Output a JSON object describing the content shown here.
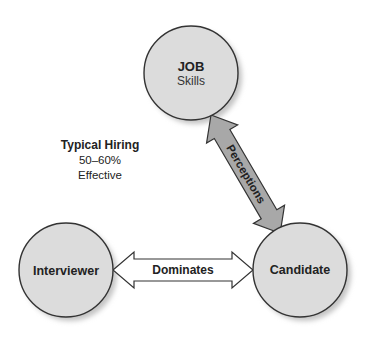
{
  "diagram": {
    "nodes": [
      {
        "id": "job",
        "title": "JOB",
        "subtitle": "Skills"
      },
      {
        "id": "interviewer",
        "title": "Interviewer"
      },
      {
        "id": "candidate",
        "title": "Candidate"
      }
    ],
    "edges": [
      {
        "from": "job",
        "to": "candidate",
        "label": "Perceptions",
        "style": "double-arrow-gray"
      },
      {
        "from": "interviewer",
        "to": "candidate",
        "label": "Dominates",
        "style": "double-arrow-white"
      }
    ],
    "note": {
      "title": "Typical Hiring",
      "line1": "50–60%",
      "line2": "Effective"
    },
    "colors": {
      "circle_fill": "#dcdcdc",
      "circle_stroke": "#333333",
      "shadow": "#c8c8c8",
      "perceptions_arrow_fill": "#a8a8a8",
      "dominates_arrow_fill": "#ffffff"
    }
  }
}
